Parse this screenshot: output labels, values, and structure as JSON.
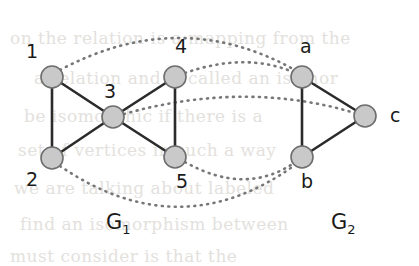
{
  "figure": {
    "type": "graph-isomorphism-diagram",
    "background_color": "#ffffff",
    "node_fill": "#c9c9c9",
    "node_stroke": "#6e6e6e",
    "solid_edge_color": "#2b2b2b",
    "dotted_edge_color": "#777777",
    "label_color": "#1a1a1a"
  },
  "graphs": [
    {
      "id": "G1",
      "label": "G",
      "subscript": "1",
      "label_x": 106,
      "label_y": 212,
      "nodes": [
        {
          "id": "1",
          "label": "1",
          "cx": 52,
          "cy": 77,
          "r": 11,
          "label_x": 26,
          "label_y": 42
        },
        {
          "id": "2",
          "label": "2",
          "cx": 52,
          "cy": 158,
          "r": 11,
          "label_x": 26,
          "label_y": 170
        },
        {
          "id": "3",
          "label": "3",
          "cx": 113,
          "cy": 117,
          "r": 11,
          "label_x": 104,
          "label_y": 82
        },
        {
          "id": "4",
          "label": "4",
          "cx": 175,
          "cy": 77,
          "r": 11,
          "label_x": 175,
          "label_y": 37
        },
        {
          "id": "5",
          "label": "5",
          "cx": 175,
          "cy": 157,
          "r": 11,
          "label_x": 176,
          "label_y": 172
        }
      ],
      "edges": [
        {
          "from": "1",
          "to": "2"
        },
        {
          "from": "1",
          "to": "3"
        },
        {
          "from": "2",
          "to": "3"
        },
        {
          "from": "3",
          "to": "4"
        },
        {
          "from": "3",
          "to": "5"
        },
        {
          "from": "4",
          "to": "5"
        }
      ]
    },
    {
      "id": "G2",
      "label": "G",
      "subscript": "2",
      "label_x": 331,
      "label_y": 212,
      "nodes": [
        {
          "id": "a",
          "label": "a",
          "cx": 302,
          "cy": 77,
          "r": 11,
          "label_x": 300,
          "label_y": 37
        },
        {
          "id": "b",
          "label": "b",
          "cx": 302,
          "cy": 157,
          "r": 11,
          "label_x": 301,
          "label_y": 172
        },
        {
          "id": "c",
          "label": "c",
          "cx": 365,
          "cy": 116,
          "r": 11,
          "label_x": 390,
          "label_y": 106
        }
      ],
      "edges": [
        {
          "from": "a",
          "to": "b"
        },
        {
          "from": "a",
          "to": "c"
        },
        {
          "from": "b",
          "to": "c"
        }
      ]
    }
  ],
  "mapping": {
    "style": "dotted",
    "pairs": [
      {
        "from": "1",
        "to": "a",
        "path": "M 60 70 Q 180 6 295 70"
      },
      {
        "from": "4",
        "to": "a",
        "path": "M 185 73 Q 245 52 293 72"
      },
      {
        "from": "3",
        "to": "c",
        "path": "M 124 114 Q 245 80 355 113"
      },
      {
        "from": "5",
        "to": "b",
        "path": "M 185 162 Q 245 196 294 163"
      },
      {
        "from": "2",
        "to": "b",
        "path": "M 60 166 Q 180 248 295 165"
      }
    ]
  },
  "background_text": [
    {
      "text": "on the relation is a mapping from the",
      "x": 10,
      "y": 28
    },
    {
      "text": "a relation and is called an isomor",
      "x": 34,
      "y": 68
    },
    {
      "text": "be isomorphic if there is a",
      "x": 24,
      "y": 106
    },
    {
      "text": "set of vertices in such a way",
      "x": 18,
      "y": 140
    },
    {
      "text": "we are talking about labeled",
      "x": 14,
      "y": 178
    },
    {
      "text": "find an isomorphism between",
      "x": 20,
      "y": 214
    },
    {
      "text": "must consider is that the",
      "x": 10,
      "y": 246
    }
  ]
}
